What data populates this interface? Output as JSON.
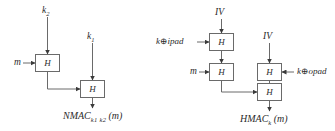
{
  "figure": {
    "stroke_color": "#6a6a6a",
    "text_color": "#2b2b2b",
    "background": "#ffffff"
  },
  "nmac": {
    "caption_name": "NMAC",
    "caption_sub": "k1 k2",
    "caption_arg": "(m)",
    "keys": {
      "k2": "k",
      "k2_sub": "2",
      "k1": "k",
      "k1_sub": "1"
    },
    "message_label": "m",
    "blocks": [
      {
        "label": "H"
      },
      {
        "label": "H"
      }
    ]
  },
  "hmac": {
    "caption_name": "HMAC",
    "caption_sub": "k",
    "caption_arg": "(m)",
    "iv_label_1": "IV",
    "iv_label_2": "IV",
    "ipad_label": "k⊕ipad",
    "opad_label": "k⊕opad",
    "message_label": "m",
    "blocks": [
      {
        "label": "H"
      },
      {
        "label": "H"
      },
      {
        "label": "H"
      },
      {
        "label": "H"
      }
    ]
  }
}
